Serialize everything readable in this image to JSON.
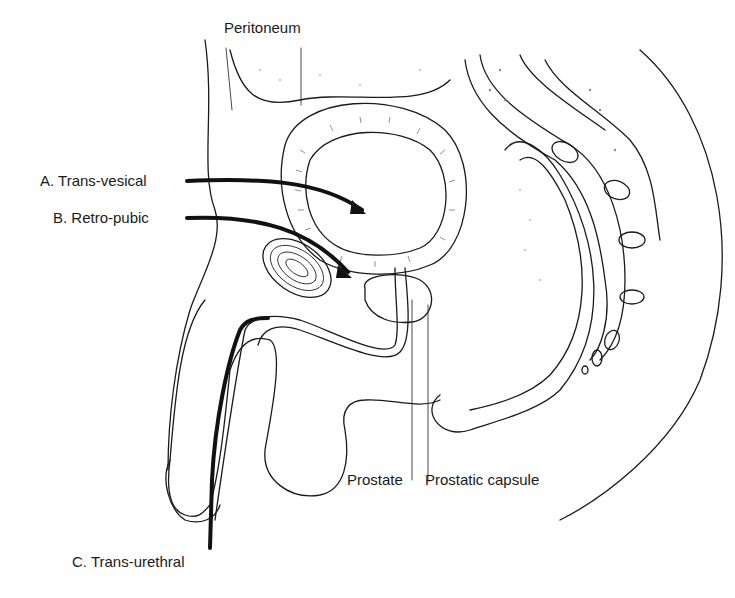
{
  "figure": {
    "labels": {
      "peritoneum": "Peritoneum",
      "approach_a": "A. Trans-vesical",
      "approach_b": "B. Retro-pubic",
      "approach_c": "C. Trans-urethral",
      "prostate": "Prostate",
      "prostatic_capsule": "Prostatic capsule"
    },
    "colors": {
      "line": "#1a1a1a",
      "background": "#ffffff",
      "stipple": "#888888"
    }
  }
}
